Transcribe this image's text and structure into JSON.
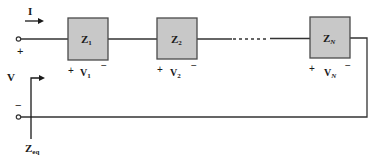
{
  "diagram": {
    "type": "series-impedance-circuit",
    "current_label": "I",
    "voltage_label": "V",
    "equivalent_label": "Z",
    "equivalent_subscript": "eq",
    "input_terminal_plus": "+",
    "input_terminal_minus": "−",
    "ellipsis": "......",
    "colors": {
      "box_fill": "#c8c8c8",
      "box_stroke": "#4a4a4a",
      "wire": "#333333",
      "text": "#1a1a1a"
    },
    "elements": [
      {
        "name": "Z",
        "sub": "1",
        "voltage": "V",
        "vsub": "1",
        "plus": "+",
        "minus": "−"
      },
      {
        "name": "Z",
        "sub": "2",
        "voltage": "V",
        "vsub": "2",
        "plus": "+",
        "minus": "−"
      },
      {
        "name": "Z",
        "sub": "N",
        "voltage": "V",
        "vsub": "N",
        "plus": "+",
        "minus": "−"
      }
    ]
  }
}
